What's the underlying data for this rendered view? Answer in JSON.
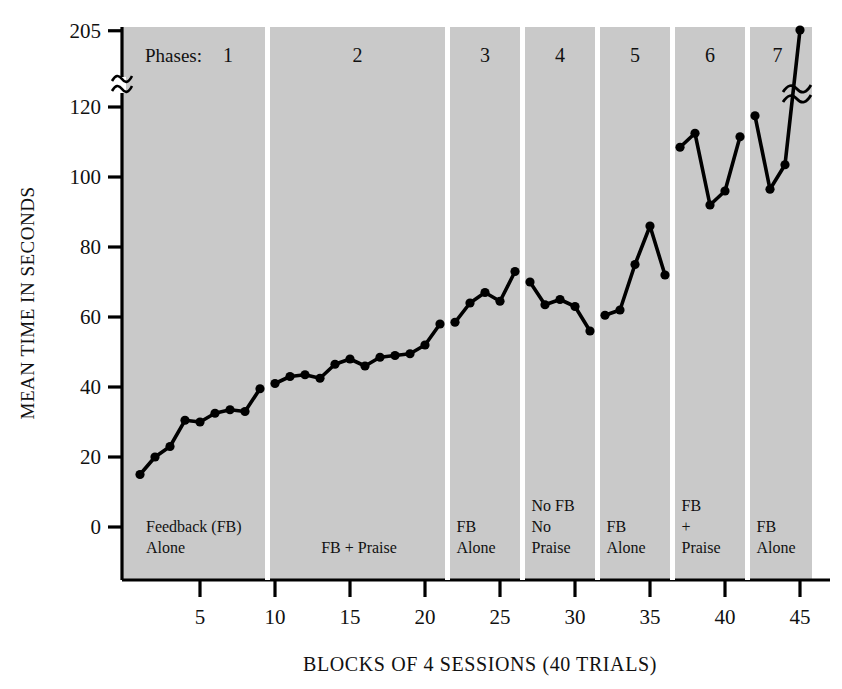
{
  "chart_data": {
    "type": "line",
    "title": "",
    "xlabel": "BLOCKS OF 4 SESSIONS (40 TRIALS)",
    "ylabel": "MEAN TIME IN SECONDS",
    "xlim": [
      0,
      46
    ],
    "ylim": [
      0,
      205
    ],
    "grid": false,
    "legend": null,
    "axis_break": {
      "present": true,
      "between": [
        120,
        205
      ],
      "symbol": "~"
    },
    "ytick_labels": [
      "0",
      "20",
      "40",
      "60",
      "80",
      "100",
      "120",
      "205"
    ],
    "ytick_values": [
      0,
      20,
      40,
      60,
      80,
      100,
      120,
      205
    ],
    "xtick_labels": [
      "5",
      "10",
      "15",
      "20",
      "25",
      "30",
      "35",
      "40",
      "45"
    ],
    "xtick_values": [
      5,
      10,
      15,
      20,
      25,
      30,
      35,
      40,
      45
    ],
    "phases_label": "Phases:",
    "phase_numbers": [
      "1",
      "2",
      "3",
      "4",
      "5",
      "6",
      "7"
    ],
    "phase_captions": [
      "Feedback (FB)\nAlone",
      "FB + Praise",
      "FB\nAlone",
      "No FB\nNo\nPraise",
      "FB\nAlone",
      "FB\n+\nPraise",
      "FB\nAlone"
    ],
    "phase_ranges": [
      [
        1,
        9
      ],
      [
        10,
        21
      ],
      [
        22,
        26
      ],
      [
        27,
        31
      ],
      [
        32,
        36
      ],
      [
        37,
        41
      ],
      [
        42,
        45
      ]
    ],
    "series": [
      {
        "name": "Mean time in seconds",
        "x": [
          1,
          2,
          3,
          4,
          5,
          6,
          7,
          8,
          9,
          10,
          11,
          12,
          13,
          14,
          15,
          16,
          17,
          18,
          19,
          20,
          21,
          22,
          23,
          24,
          25,
          26,
          27,
          28,
          29,
          30,
          31,
          32,
          33,
          34,
          35,
          36,
          37,
          38,
          39,
          40,
          41,
          42,
          43,
          44,
          45
        ],
        "values": [
          15,
          20,
          23,
          30.5,
          30,
          32.5,
          33.5,
          33,
          39.5,
          41,
          43,
          43.5,
          42.5,
          46.5,
          48,
          46,
          48.5,
          49,
          49.5,
          52,
          58,
          58.5,
          64,
          67,
          64.5,
          73,
          70,
          63.5,
          65,
          63,
          56,
          60.5,
          62,
          75,
          86,
          72,
          108.5,
          112.5,
          92,
          96,
          111.5,
          117.5,
          96.5,
          103.5,
          206
        ]
      }
    ]
  },
  "axis": {
    "ylabel": "MEAN TIME IN SECONDS",
    "xlabel": "BLOCKS OF 4 SESSIONS (40 TRIALS)"
  },
  "colors": {
    "plot_background": "#c9c9c9",
    "line": "#000000",
    "marker": "#000000",
    "axis": "#000000",
    "separator": "#ffffff",
    "page_background": "#ffffff"
  }
}
